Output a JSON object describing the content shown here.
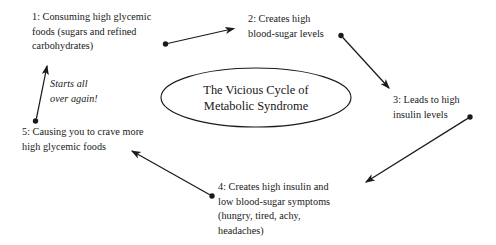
{
  "diagram": {
    "type": "cycle",
    "background_color": "#ffffff",
    "line_color": "#1a1a1a",
    "center": {
      "shape": "ellipse",
      "label": "The Vicious Cycle of\nMetabolic Syndrome"
    },
    "annotation": {
      "label": "Starts all\nover again!",
      "style": "italic"
    },
    "steps": [
      {
        "number": "1",
        "label": "1: Consuming high glycemic\nfoods (sugars and refined\ncarbohydrates)"
      },
      {
        "number": "2",
        "label": "2: Creates high\nblood-sugar levels"
      },
      {
        "number": "3",
        "label": "3: Leads to high\ninsulin levels"
      },
      {
        "number": "4",
        "label": "4: Creates high insulin and\nlow blood-sugar symptoms\n(hungry, tired, achy,\nheadaches)"
      },
      {
        "number": "5",
        "label": "5: Causing you to crave more\nhigh glycemic foods"
      }
    ],
    "arrows": [
      {
        "name": "arrow-1-to-2",
        "from": "1",
        "to": "2"
      },
      {
        "name": "arrow-2-to-3",
        "from": "2",
        "to": "3"
      },
      {
        "name": "arrow-3-to-4",
        "from": "3",
        "to": "4"
      },
      {
        "name": "arrow-4-to-5",
        "from": "4",
        "to": "5"
      },
      {
        "name": "arrow-5-to-1",
        "from": "5",
        "to": "1"
      }
    ]
  }
}
